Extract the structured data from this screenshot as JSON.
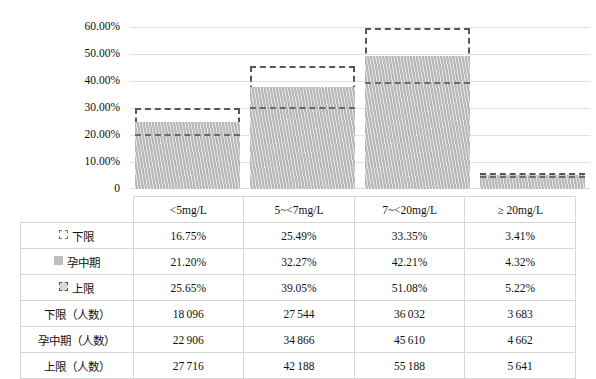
{
  "chart_data": {
    "type": "bar",
    "title": "",
    "subtitle": "",
    "xlabel": "",
    "ylabel": "",
    "grid": true,
    "legend_position": "table-left",
    "categories": [
      "<5mg/L",
      "5~<7mg/L",
      "7~<20mg/L",
      "≥ 20mg/L"
    ],
    "ylim": [
      0,
      60
    ],
    "ytick_labels": [
      "60.00%",
      "50.00%",
      "40.00%",
      "30.00%",
      "20.00%",
      "10.00%",
      "0"
    ],
    "ytick_values": [
      60,
      50,
      40,
      30,
      20,
      10,
      0
    ],
    "series": [
      {
        "name": "下限",
        "values": [
          16.75,
          25.49,
          33.35,
          3.41
        ]
      },
      {
        "name": "孕中期",
        "values": [
          21.2,
          32.27,
          42.21,
          4.32
        ]
      },
      {
        "name": "上限",
        "values": [
          25.65,
          39.05,
          51.08,
          5.22
        ]
      }
    ],
    "counts_series": [
      {
        "name": "下限（人数）",
        "values": [
          18096,
          27544,
          36032,
          3683
        ]
      },
      {
        "name": "孕中期（人数）",
        "values": [
          22906,
          34866,
          45610,
          4662
        ]
      },
      {
        "name": "上限（人数）",
        "values": [
          27716,
          42188,
          55188,
          5641
        ]
      }
    ]
  },
  "axis": {
    "y_ticks": [
      {
        "label": "60.00%"
      },
      {
        "label": "50.00%"
      },
      {
        "label": "40.00%"
      },
      {
        "label": "30.00%"
      },
      {
        "label": "20.00%"
      },
      {
        "label": "10.00%"
      },
      {
        "label": "0"
      }
    ]
  },
  "table": {
    "corner": "",
    "headers": [
      "<5mg/L",
      "5~<7mg/L",
      "7~<20mg/L",
      "≥ 20mg/L"
    ],
    "rows": [
      {
        "label": "下限",
        "marker": "dashed-square-icon",
        "cells": [
          "16.75%",
          "25.49%",
          "33.35%",
          "3.41%"
        ]
      },
      {
        "label": "孕中期",
        "marker": "solid-gray-square-icon",
        "cells": [
          "21.20%",
          "32.27%",
          "42.21%",
          "4.32%"
        ]
      },
      {
        "label": "上限",
        "marker": "dashed-filled-square-icon",
        "cells": [
          "25.65%",
          "39.05%",
          "51.08%",
          "5.22%"
        ]
      },
      {
        "label": "下限（人数）",
        "marker": "",
        "cells": [
          "18 096",
          "27 544",
          "36 032",
          "3 683"
        ]
      },
      {
        "label": "孕中期（人数）",
        "marker": "",
        "cells": [
          "22 906",
          "34 866",
          "45 610",
          "4 662"
        ]
      },
      {
        "label": "上限（人数）",
        "marker": "",
        "cells": [
          "27 716",
          "42 188",
          "55 188",
          "5 641"
        ]
      }
    ]
  },
  "caption": "",
  "colors": {
    "bar_fill": "#c3c3c3",
    "bar_outline": "#575757",
    "gridline": "#e2e2e2",
    "table_border": "#d6d6d6",
    "text": "#111111",
    "background": "#ffffff"
  }
}
